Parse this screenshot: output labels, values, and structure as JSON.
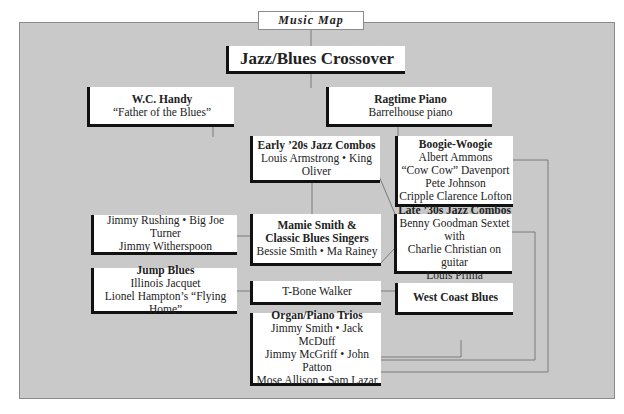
{
  "header": {
    "tab_label": "Music Map"
  },
  "main": {
    "title": "Jazz/Blues Crossover",
    "nodes": {
      "wc_handy": {
        "title": "W.C. Handy",
        "lines": [
          "“Father of the Blues”"
        ]
      },
      "ragtime": {
        "title": "Ragtime Piano",
        "lines": [
          "Barrelhouse piano"
        ]
      },
      "early20s": {
        "title": "Early ’20s Jazz Combos",
        "lines": [
          "Louis Armstrong • King Oliver"
        ]
      },
      "boogie": {
        "title": "Boogie-Woogie",
        "lines": [
          "Albert Ammons",
          "“Cow Cow” Davenport",
          "Pete Johnson",
          "Cripple Clarence Lofton"
        ]
      },
      "rushing": {
        "lines": [
          "Jimmy Rushing • Big Joe Turner",
          "Jimmy Witherspoon"
        ]
      },
      "mamie": {
        "title": "Mamie Smith &",
        "title2": "Classic Blues Singers",
        "lines": [
          "Bessie Smith • Ma Rainey"
        ]
      },
      "late30s": {
        "title": "Late ’30s Jazz Combos",
        "lines": [
          "Benny Goodman Sextet with",
          "Charlie Christian on guitar",
          "Louis Prima"
        ]
      },
      "jump": {
        "title": "Jump Blues",
        "lines": [
          "Illinois Jacquet",
          "Lionel Hampton’s “Flying Home”"
        ]
      },
      "tbone": {
        "lines": [
          "T-Bone Walker"
        ]
      },
      "westcoast": {
        "title": "West Coast Blues"
      },
      "organ": {
        "title": "Organ/Piano Trios",
        "lines": [
          "Jimmy Smith • Jack McDuff",
          "Jimmy McGriff • John Patton",
          "Mose Allison • Sam Lazar"
        ]
      }
    }
  },
  "colors": {
    "panel": "#c9c9c9",
    "box": "#ffffff",
    "shadow": "#111111",
    "line": "#7a7a7a"
  }
}
